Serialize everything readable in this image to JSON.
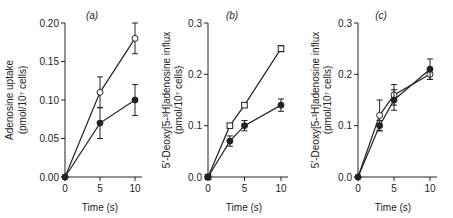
{
  "chart_data": [
    {
      "type": "line",
      "panel": "(a)",
      "title": "",
      "xlabel": "Time (s)",
      "ylabel": "Adenosine uptake (pmol/10^7 cells)",
      "xlim": [
        0,
        10
      ],
      "ylim": [
        0,
        0.2
      ],
      "xticks": [
        "0",
        "5",
        "10"
      ],
      "yticks": [
        "0.00",
        "0.05",
        "0.10",
        "0.15",
        "0.20"
      ],
      "grid": false,
      "series": [
        {
          "name": "open circles",
          "marker": "open-circle",
          "x": [
            0,
            5,
            10
          ],
          "values": [
            0.0,
            0.11,
            0.18
          ],
          "errors": [
            0,
            0.02,
            0.02
          ]
        },
        {
          "name": "filled circles",
          "marker": "filled-circle",
          "x": [
            0,
            5,
            10
          ],
          "values": [
            0.0,
            0.07,
            0.1
          ],
          "errors": [
            0,
            0.02,
            0.02
          ]
        }
      ]
    },
    {
      "type": "line",
      "panel": "(b)",
      "title": "",
      "xlabel": "Time (s)",
      "ylabel": "5'-Deoxy[5-3H]adenosine influx (pmol/10^7 cells)",
      "xlim": [
        0,
        10
      ],
      "ylim": [
        0,
        0.3
      ],
      "xticks": [
        "0",
        "5",
        "10"
      ],
      "yticks": [
        "0.0",
        "0.1",
        "0.2",
        "0.3"
      ],
      "grid": false,
      "series": [
        {
          "name": "open squares",
          "marker": "open-square",
          "x": [
            0,
            3,
            5,
            10
          ],
          "values": [
            0.0,
            0.1,
            0.14,
            0.25
          ],
          "errors": [
            0,
            0.004,
            0.004,
            0.006
          ]
        },
        {
          "name": "filled circles",
          "marker": "filled-circle",
          "x": [
            0,
            3,
            5,
            10
          ],
          "values": [
            0.0,
            0.07,
            0.1,
            0.14
          ],
          "errors": [
            0,
            0.01,
            0.01,
            0.012
          ]
        }
      ]
    },
    {
      "type": "line",
      "panel": "(c)",
      "title": "",
      "xlabel": "Time (s)",
      "ylabel": "5'-Deoxy[5-3H]adenosine influx (pmol/10^7 cells)",
      "xlim": [
        0,
        10
      ],
      "ylim": [
        0,
        0.3
      ],
      "xticks": [
        "0",
        "5",
        "10"
      ],
      "yticks": [
        "0.0",
        "0.1",
        "0.2",
        "0.3"
      ],
      "grid": false,
      "series": [
        {
          "name": "open circles",
          "marker": "open-circle",
          "x": [
            0,
            3,
            5,
            10
          ],
          "values": [
            0.0,
            0.12,
            0.16,
            0.2
          ],
          "errors": [
            0,
            0.03,
            0.02,
            0.01
          ]
        },
        {
          "name": "filled circles",
          "marker": "filled-circle",
          "x": [
            0,
            3,
            5,
            10
          ],
          "values": [
            0.0,
            0.1,
            0.15,
            0.21
          ],
          "errors": [
            0,
            0.01,
            0.02,
            0.02
          ]
        }
      ]
    }
  ],
  "labels": {
    "a": {
      "panel": "(a)",
      "ylabel_line1": "Adenosine uptake",
      "ylabel_line2": "(pmol/10⁷ cells)",
      "xlabel": "Time (s)",
      "yticks": [
        "0.00",
        "0.05",
        "0.10",
        "0.15",
        "0.20"
      ],
      "xticks": [
        "0",
        "5",
        "10"
      ]
    },
    "b": {
      "panel": "(b)",
      "ylabel_line1": "5′-Deoxy[5-³H]adenosine influx",
      "ylabel_line2": "(pmol/10⁷ cells)",
      "xlabel": "Time (s)",
      "yticks": [
        "0.0",
        "0.1",
        "0.2",
        "0.3"
      ],
      "xticks": [
        "0",
        "5",
        "10"
      ]
    },
    "c": {
      "panel": "(c)",
      "ylabel_line1": "5′-Deoxy[5-³H]adenosine influx",
      "ylabel_line2": "(pmol/10⁷ cells)",
      "xlabel": "Time (s)",
      "yticks": [
        "0.0",
        "0.1",
        "0.2",
        "0.3"
      ],
      "xticks": [
        "0",
        "5",
        "10"
      ]
    }
  }
}
